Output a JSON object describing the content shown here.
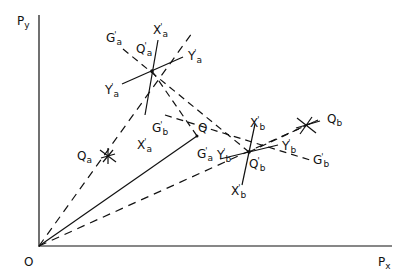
{
  "diagram": {
    "type": "geometric construction",
    "axes": {
      "x_label": "P",
      "x_sub": "x",
      "y_label": "P",
      "y_sub": "y",
      "origin_label": "O"
    },
    "points": {
      "Q": {
        "label": "Q",
        "sub": ""
      },
      "Qa": {
        "label": "Q",
        "sub": "a"
      },
      "Qb": {
        "label": "Q",
        "sub": "b"
      },
      "Qa_prime": {
        "label": "Q",
        "sub": "a",
        "prime": "'"
      },
      "Qb_prime": {
        "label": "Q",
        "sub": "b",
        "prime": "'"
      }
    },
    "line_labels": {
      "Ga_prime_top": {
        "label": "G",
        "sub": "a",
        "prime": "'"
      },
      "Xa_prime_top": {
        "label": "X",
        "sub": "a",
        "prime": "'"
      },
      "Ya_prime_right": {
        "label": "Y",
        "sub": "a",
        "prime": "'"
      },
      "Ya_prime_left": {
        "label": "Y",
        "sub": "a",
        "prime": "'"
      },
      "Xa_prime_bottom": {
        "label": "X",
        "sub": "a",
        "prime": "'"
      },
      "Gb_prime_mid": {
        "label": "G",
        "sub": "b",
        "prime": "'"
      },
      "Ga_prime_mid": {
        "label": "G",
        "sub": "a",
        "prime": "'"
      },
      "Yb_prime_left": {
        "label": "Y",
        "sub": "b",
        "prime": "'"
      },
      "Xb_prime_top": {
        "label": "X",
        "sub": "b",
        "prime": "'"
      },
      "Yb_prime_right": {
        "label": "Y",
        "sub": "b",
        "prime": "'"
      },
      "Gb_prime_right": {
        "label": "G",
        "sub": "b",
        "prime": "'"
      },
      "Xb_prime_bottom": {
        "label": "X",
        "sub": "b",
        "prime": "'"
      }
    },
    "colors": {
      "ink": "#111111",
      "background": "#ffffff"
    }
  }
}
